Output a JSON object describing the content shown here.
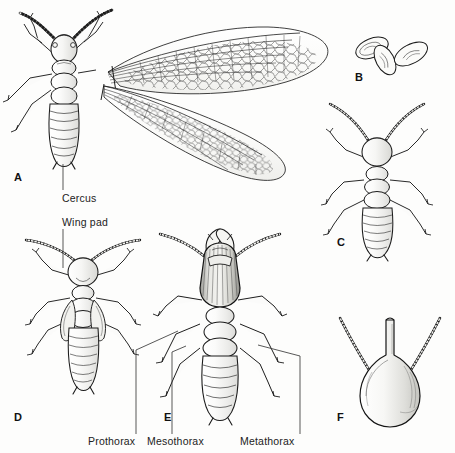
{
  "figure": {
    "domain": "scientific-illustration",
    "background_color": "#fdfdfc",
    "ink_color": "#1a1a1a",
    "width": 455,
    "height": 453
  },
  "panels": [
    {
      "id": "A",
      "letter": "A",
      "name": "winged-alate-termite",
      "description": "Dorsal view of a winged reproductive (alate) termite with two long reticulate-veined wings extended to the right",
      "letter_x": 14,
      "letter_y": 172
    },
    {
      "id": "B",
      "letter": "B",
      "name": "eggs",
      "description": "Three oval eggs with faint internal embryo markings",
      "letter_x": 355,
      "letter_y": 72
    },
    {
      "id": "C",
      "letter": "C",
      "name": "worker-termite",
      "description": "Dorsal view of a wingless worker termite with beaded antennae",
      "letter_x": 337,
      "letter_y": 237
    },
    {
      "id": "D",
      "letter": "D",
      "name": "nymph-with-wing-pads",
      "description": "Dorsal view of a nymph showing developing wing pads on the thorax",
      "letter_x": 14,
      "letter_y": 412
    },
    {
      "id": "E",
      "letter": "E",
      "name": "mandibulate-soldier",
      "description": "Dorsal view of a mandibulate soldier with enlarged dark sclerotised head and crossed mandibles",
      "letter_x": 164,
      "letter_y": 412
    },
    {
      "id": "F",
      "letter": "F",
      "name": "nasute-soldier-head",
      "description": "Head of a nasute soldier showing the pear-shaped head capsule with a pointed frontal nasus and beaded antennae",
      "letter_x": 337,
      "letter_y": 412
    }
  ],
  "annotations": [
    {
      "name": "cercus",
      "label": "Cercus",
      "text_x": 62,
      "text_y": 200,
      "leader": {
        "x1": 63,
        "y1": 164,
        "x2": 63,
        "y2": 190
      }
    },
    {
      "name": "wing-pad",
      "label": "Wing pad",
      "text_x": 62,
      "text_y": 224,
      "leader": {
        "x1": 63,
        "y1": 229,
        "x2": 63,
        "y2": 268
      }
    },
    {
      "name": "prothorax",
      "label": "Prothorax",
      "text_x": 88,
      "text_y": 442,
      "leader_path": "M 136 434 L 136 350 L 178 331"
    },
    {
      "name": "mesothorax",
      "label": "Mesothorax",
      "text_x": 147,
      "text_y": 442,
      "leader_path": "M 172 434 L 172 352 L 186 346"
    },
    {
      "name": "metathorax",
      "label": "Metathorax",
      "text_x": 240,
      "text_y": 442,
      "leader_path": "M 300 434 L 300 356 L 258 345"
    }
  ]
}
